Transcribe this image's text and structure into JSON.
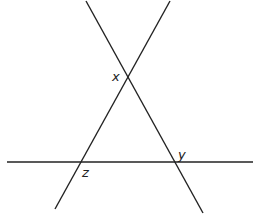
{
  "diagram": {
    "type": "geometry",
    "line_color": "#222222",
    "lines": [
      {
        "name": "line-descending",
        "x1": 86,
        "y1": 1,
        "x2": 203,
        "y2": 213
      },
      {
        "name": "line-ascending",
        "x1": 170,
        "y1": 1,
        "x2": 55,
        "y2": 209
      },
      {
        "name": "line-horizontal",
        "x1": 7,
        "y1": 162,
        "x2": 253,
        "y2": 162
      }
    ],
    "labels": [
      {
        "text": "x",
        "x": 112,
        "y": 81
      },
      {
        "text": "y",
        "x": 178,
        "y": 159
      },
      {
        "text": "z",
        "x": 82,
        "y": 177
      }
    ]
  }
}
